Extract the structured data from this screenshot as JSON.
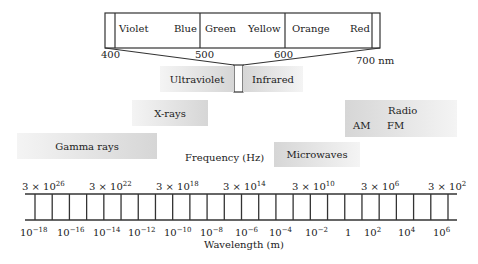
{
  "visible_spectrum": {
    "colors": [
      "Violet",
      "Blue",
      "Green",
      "Yellow",
      "Orange",
      "Red"
    ],
    "wavelength_ticks": [
      "400",
      "500",
      "600",
      "700 nm"
    ]
  },
  "bands": {
    "ultraviolet": "Ultraviolet",
    "infrared": "Infrared",
    "xrays": "X-rays",
    "gamma": "Gamma rays",
    "radio": "Radio",
    "radio_am": "AM",
    "radio_fm": "FM",
    "microwaves": "Microwaves"
  },
  "axes": {
    "frequency_label": "Frequency (Hz)",
    "wavelength_label": "Wavelength (m)",
    "frequency_ticks": [
      {
        "base": "3 × 10",
        "exp": "26"
      },
      {
        "base": "3 × 10",
        "exp": "22"
      },
      {
        "base": "3 × 10",
        "exp": "18"
      },
      {
        "base": "3 × 10",
        "exp": "14"
      },
      {
        "base": "3 × 10",
        "exp": "10"
      },
      {
        "base": "3 × 10",
        "exp": "6"
      },
      {
        "base": "3 × 10",
        "exp": "2"
      }
    ],
    "wavelength_ticks": [
      {
        "base": "10",
        "exp": "−18"
      },
      {
        "base": "10",
        "exp": "−16"
      },
      {
        "base": "10",
        "exp": "−14"
      },
      {
        "base": "10",
        "exp": "−12"
      },
      {
        "base": "10",
        "exp": "−10"
      },
      {
        "base": "10",
        "exp": "−8"
      },
      {
        "base": "10",
        "exp": "−6"
      },
      {
        "base": "10",
        "exp": "−4"
      },
      {
        "base": "10",
        "exp": "−2"
      },
      {
        "base": "1",
        "exp": ""
      },
      {
        "base": "10",
        "exp": "2"
      },
      {
        "base": "10",
        "exp": "4"
      },
      {
        "base": "10",
        "exp": "6"
      }
    ]
  }
}
